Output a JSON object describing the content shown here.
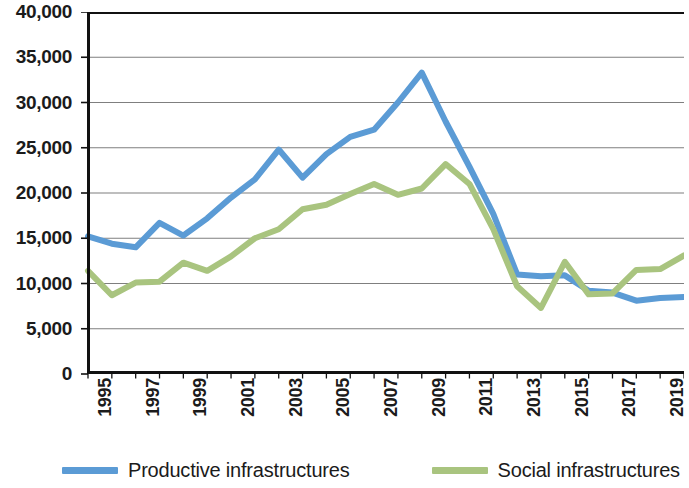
{
  "chart_data": {
    "type": "line",
    "title": "",
    "subtitle": "",
    "xlabel": "",
    "ylabel": "",
    "grid": true,
    "legend_position": "bottom",
    "ylim": [
      0,
      40000
    ],
    "ytick_step": 5000,
    "yticks": [
      0,
      5000,
      10000,
      15000,
      20000,
      25000,
      30000,
      35000,
      40000
    ],
    "ytick_labels": [
      "0",
      "5,000",
      "10,000",
      "15,000",
      "20,000",
      "25,000",
      "30,000",
      "35,000",
      "40,000"
    ],
    "x": [
      1995,
      1996,
      1997,
      1998,
      1999,
      2000,
      2001,
      2002,
      2003,
      2004,
      2005,
      2006,
      2007,
      2008,
      2009,
      2010,
      2011,
      2012,
      2013,
      2014,
      2015,
      2016,
      2017,
      2018,
      2019,
      2020
    ],
    "xtick_labels": [
      "1995",
      "1997",
      "1999",
      "2001",
      "2003",
      "2005",
      "2007",
      "2009",
      "2011",
      "2013",
      "2015",
      "2017",
      "2019"
    ],
    "xtick_values": [
      1995,
      1997,
      1999,
      2001,
      2003,
      2005,
      2007,
      2009,
      2011,
      2013,
      2015,
      2017,
      2019
    ],
    "xlim": [
      1995,
      2020
    ],
    "series": [
      {
        "name": "Productive infrastructures",
        "color": "#5B9BD5",
        "values": [
          15200,
          14400,
          14000,
          16700,
          15300,
          17200,
          19500,
          21500,
          24800,
          21700,
          24300,
          26200,
          27000,
          30000,
          33300,
          27900,
          22900,
          17700,
          11000,
          10800,
          10900,
          9200,
          9000,
          8100,
          8400,
          8500
        ]
      },
      {
        "name": "Social infrastructures",
        "color": "#A9C47F",
        "values": [
          11400,
          8700,
          10100,
          10200,
          12300,
          11400,
          13000,
          15000,
          16000,
          18200,
          18700,
          19900,
          21000,
          19800,
          20500,
          23200,
          21000,
          16000,
          9700,
          7300,
          12400,
          8800,
          8900,
          11500,
          11600,
          13100
        ]
      }
    ]
  },
  "legend": {
    "items": [
      {
        "label": "Productive infrastructures",
        "color": "#5B9BD5"
      },
      {
        "label": "Social infrastructures",
        "color": "#A9C47F"
      }
    ]
  }
}
